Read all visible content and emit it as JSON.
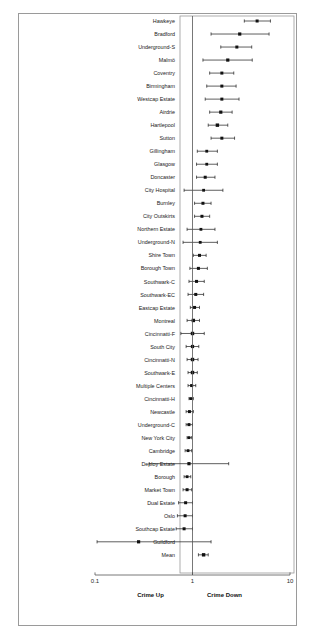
{
  "figure": {
    "type": "forest-plot",
    "title": "",
    "frame_color": "#9a9a9a",
    "marker_color": "#111111"
  },
  "axis": {
    "scale": "log10",
    "tick_labels": [
      "0.1",
      "1",
      "10"
    ],
    "tick_values": [
      0.1,
      1,
      10
    ],
    "xlim": [
      0.1,
      10
    ],
    "null_value": 1,
    "left_annotation": "Crime Up",
    "right_annotation": "Crime Down"
  },
  "chart_data": {
    "type": "scatter",
    "subtype": "forest",
    "title": "",
    "xlabel": "",
    "ylabel": "",
    "xlim": [
      0.1,
      10
    ],
    "xscale": "log10",
    "grid": false,
    "legend": "none",
    "xticks": [
      0.1,
      1,
      10
    ],
    "xticklabels": [
      "0.1",
      "1",
      "10"
    ],
    "annotations": [
      "Crime Up",
      "Crime Down"
    ],
    "reference_line": 1,
    "categories": [
      "Hawkeye",
      "Bradford",
      "Underground-S",
      "Malmö",
      "Coventry",
      "Birmingham",
      "Westcap Estate",
      "Airdrie",
      "Hartlepool",
      "Sutton",
      "Gillingham",
      "Glasgow",
      "Doncaster",
      "City Hospital",
      "Burnley",
      "City Outskirts",
      "Northern Estate",
      "Underground-N",
      "Shire Town",
      "Borough Town",
      "Southwark-C",
      "Southwark-EC",
      "Eastcap Estate",
      "Montreal",
      "Cincinnatti-F",
      "South City",
      "Cincinnatti-N",
      "Southwark-E",
      "Multiple Centers",
      "Cincinnatti-H",
      "Newcastle",
      "Underground-C",
      "New York City",
      "Cambridge",
      "Deploy Estate",
      "Borough",
      "Market Town",
      "Dual Estate",
      "Oslo",
      "Southcap Estate",
      "Guildford",
      "Mean"
    ],
    "points": [
      {
        "label": "Hawkeye",
        "estimate": 4.6,
        "ci_low": 3.4,
        "ci_high": 6.3,
        "marker_size": 3.0
      },
      {
        "label": "Bradford",
        "estimate": 3.05,
        "ci_low": 1.55,
        "ci_high": 6.1,
        "marker_size": 3.2
      },
      {
        "label": "Underground-S",
        "estimate": 2.85,
        "ci_low": 1.95,
        "ci_high": 4.05,
        "marker_size": 3.0
      },
      {
        "label": "Malmö",
        "estimate": 2.3,
        "ci_low": 1.28,
        "ci_high": 4.1,
        "marker_size": 3.2
      },
      {
        "label": "Coventry",
        "estimate": 2.0,
        "ci_low": 1.5,
        "ci_high": 2.65,
        "marker_size": 3.0
      },
      {
        "label": "Birmingham",
        "estimate": 2.0,
        "ci_low": 1.4,
        "ci_high": 2.8,
        "marker_size": 3.0
      },
      {
        "label": "Westcap Estate",
        "estimate": 2.0,
        "ci_low": 1.35,
        "ci_high": 3.0,
        "marker_size": 3.0
      },
      {
        "label": "Airdrie",
        "estimate": 1.95,
        "ci_low": 1.5,
        "ci_high": 2.55,
        "marker_size": 3.2
      },
      {
        "label": "Hartlepool",
        "estimate": 1.8,
        "ci_low": 1.45,
        "ci_high": 2.3,
        "marker_size": 3.4
      },
      {
        "label": "Sutton",
        "estimate": 2.0,
        "ci_low": 1.55,
        "ci_high": 2.7,
        "marker_size": 3.0
      },
      {
        "label": "Gillingham",
        "estimate": 1.4,
        "ci_low": 1.12,
        "ci_high": 1.8,
        "marker_size": 2.8
      },
      {
        "label": "Glasgow",
        "estimate": 1.4,
        "ci_low": 1.1,
        "ci_high": 1.8,
        "marker_size": 2.8
      },
      {
        "label": "Doncaster",
        "estimate": 1.35,
        "ci_low": 1.1,
        "ci_high": 1.7,
        "marker_size": 3.0
      },
      {
        "label": "City Hospital",
        "estimate": 1.3,
        "ci_low": 0.82,
        "ci_high": 2.05,
        "marker_size": 2.8
      },
      {
        "label": "Burnley",
        "estimate": 1.28,
        "ci_low": 1.05,
        "ci_high": 1.55,
        "marker_size": 3.0
      },
      {
        "label": "City Outskirts",
        "estimate": 1.25,
        "ci_low": 1.05,
        "ci_high": 1.5,
        "marker_size": 3.0
      },
      {
        "label": "Northern Estate",
        "estimate": 1.22,
        "ci_low": 0.88,
        "ci_high": 1.7,
        "marker_size": 2.8
      },
      {
        "label": "Underground-N",
        "estimate": 1.2,
        "ci_low": 0.8,
        "ci_high": 1.8,
        "marker_size": 2.8
      },
      {
        "label": "Shire Town",
        "estimate": 1.18,
        "ci_low": 1.02,
        "ci_high": 1.38,
        "marker_size": 3.0
      },
      {
        "label": "Borough Town",
        "estimate": 1.15,
        "ci_low": 0.94,
        "ci_high": 1.42,
        "marker_size": 3.0
      },
      {
        "label": "Southwark-C",
        "estimate": 1.1,
        "ci_low": 0.92,
        "ci_high": 1.32,
        "marker_size": 3.0
      },
      {
        "label": "Southwark-EC",
        "estimate": 1.08,
        "ci_low": 0.9,
        "ci_high": 1.3,
        "marker_size": 3.0
      },
      {
        "label": "Eastcap Estate",
        "estimate": 1.05,
        "ci_low": 0.95,
        "ci_high": 1.18,
        "marker_size": 3.0
      },
      {
        "label": "Montreal",
        "estimate": 1.02,
        "ci_low": 0.88,
        "ci_high": 1.18,
        "marker_size": 3.4
      },
      {
        "label": "Cincinnatti-F",
        "estimate": 1.0,
        "ci_low": 0.76,
        "ci_high": 1.32,
        "marker_size": 3.4
      },
      {
        "label": "South City",
        "estimate": 1.0,
        "ci_low": 0.86,
        "ci_high": 1.16,
        "marker_size": 3.2
      },
      {
        "label": "Cincinnatti-N",
        "estimate": 1.0,
        "ci_low": 0.88,
        "ci_high": 1.14,
        "marker_size": 3.4
      },
      {
        "label": "Southwark-E",
        "estimate": 1.0,
        "ci_low": 0.9,
        "ci_high": 1.12,
        "marker_size": 3.4
      },
      {
        "label": "Multiple Centers",
        "estimate": 0.98,
        "ci_low": 0.9,
        "ci_high": 1.08,
        "marker_size": 3.0
      },
      {
        "label": "Cincinnatti-H",
        "estimate": 0.96,
        "ci_low": 0.92,
        "ci_high": 1.02,
        "marker_size": 2.8
      },
      {
        "label": "Newcastle",
        "estimate": 0.93,
        "ci_low": 0.86,
        "ci_high": 1.02,
        "marker_size": 3.0
      },
      {
        "label": "Underground-C",
        "estimate": 0.92,
        "ci_low": 0.86,
        "ci_high": 1.0,
        "marker_size": 3.0
      },
      {
        "label": "New York City",
        "estimate": 0.92,
        "ci_low": 0.88,
        "ci_high": 0.98,
        "marker_size": 2.8
      },
      {
        "label": "Cambridge",
        "estimate": 0.9,
        "ci_low": 0.84,
        "ci_high": 0.98,
        "marker_size": 2.8
      },
      {
        "label": "Deploy Estate",
        "estimate": 0.92,
        "ci_low": 0.36,
        "ci_high": 2.35,
        "marker_size": 3.2
      },
      {
        "label": "Borough",
        "estimate": 0.88,
        "ci_low": 0.82,
        "ci_high": 0.96,
        "marker_size": 2.8
      },
      {
        "label": "Market Town",
        "estimate": 0.88,
        "ci_low": 0.8,
        "ci_high": 0.98,
        "marker_size": 3.0
      },
      {
        "label": "Dual Estate",
        "estimate": 0.85,
        "ci_low": 0.72,
        "ci_high": 1.0,
        "marker_size": 3.0
      },
      {
        "label": "Oslo",
        "estimate": 0.84,
        "ci_low": 0.7,
        "ci_high": 1.0,
        "marker_size": 3.0
      },
      {
        "label": "Southcap Estate",
        "estimate": 0.82,
        "ci_low": 0.68,
        "ci_high": 1.0,
        "marker_size": 3.0
      },
      {
        "label": "Guildford",
        "estimate": 0.28,
        "ci_low": 0.105,
        "ci_high": 1.55,
        "marker_size": 3.2
      },
      {
        "label": "Mean",
        "estimate": 1.3,
        "ci_low": 1.15,
        "ci_high": 1.45,
        "marker_size": 3.4
      }
    ]
  },
  "layout": {
    "outer_frame": {
      "x": 18,
      "y": 13,
      "w": 279,
      "h": 613
    },
    "panel": {
      "x": 180,
      "y": 16,
      "w": 114,
      "h": 557
    },
    "label_col_right": 175,
    "axis_y": 575,
    "x_pixel_for_0p1": 95,
    "x_pixel_for_1": 192,
    "x_pixel_for_10": 290,
    "first_row_y": 21,
    "row_spacing": 13.02
  }
}
